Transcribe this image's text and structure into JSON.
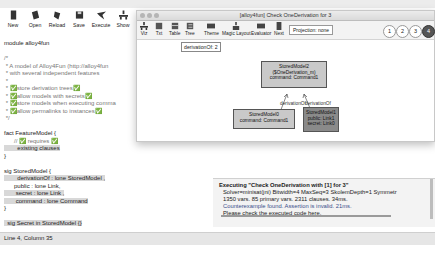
{
  "main_window": {
    "toolbar": [
      {
        "label": "New",
        "icon": "new-file-icon"
      },
      {
        "label": "Open",
        "icon": "open-folder-icon"
      },
      {
        "label": "Reload",
        "icon": "reload-icon"
      },
      {
        "label": "Save",
        "icon": "save-icon"
      },
      {
        "label": "Execute",
        "icon": "execute-icon"
      },
      {
        "label": "Show",
        "icon": "show-icon"
      }
    ],
    "code": [
      "module alloy4fun",
      "",
      "/*",
      " * A model of Alloy4Fun (http://alloy4fun",
      " * with several independent features",
      " *",
      " * ✅store derivation trees✅",
      " * ✅allow models with secrets✅",
      " * ✅store models when executing comma",
      " * ✅allow permalinks to instances✅",
      " */",
      "",
      "fact FeatureModel {",
      "      // ✅ requires ✅",
      "        existing clauses",
      "}",
      "",
      "sig StoredModel {",
      "        derivationOf : lone StoredModel ,",
      "      public : lone Link,",
      "       secret : lone Link ,",
      "       command : lone Command",
      "}",
      "",
      "  sig Secret in StoredModel {}"
    ],
    "status": "Line 4, Column 35"
  },
  "viz_window": {
    "title": "[alloy4fun] Check OneDerivation for 3",
    "toolbar": [
      {
        "label": "Viz",
        "icon": "viz-icon"
      },
      {
        "label": "Txt",
        "icon": "text-icon"
      },
      {
        "label": "Table",
        "icon": "table-icon"
      },
      {
        "label": "Tree",
        "icon": "tree-icon"
      },
      {
        "label": "Theme",
        "icon": "theme-icon"
      },
      {
        "label": "Magic Layout",
        "icon": "magic-layout-icon"
      },
      {
        "label": "Evaluator",
        "icon": "evaluator-icon"
      },
      {
        "label": "Next",
        "icon": "next-icon"
      }
    ],
    "projection": "Projection: none",
    "instances": [
      "1",
      "2",
      "3",
      "4"
    ],
    "active_instance": "4",
    "tag": "derivationOf: 2",
    "nodes": [
      {
        "lines": [
          "StoredModel2",
          "($OneDerivation_m)",
          "command: Command1"
        ]
      },
      {
        "lines": [
          "StoredModel0",
          "command: Command1"
        ]
      },
      {
        "lines": [
          "StoredModel1",
          "public: Link1",
          "secret: Link0"
        ]
      }
    ],
    "edges": [
      {
        "label": "derivationOf"
      },
      {
        "label": "derivationOf"
      }
    ]
  },
  "output": {
    "lines": [
      "Executing \"Check OneDerivation with [1] for 3\"",
      "Solver=minisat(jni) Bitwidth=4 MaxSeq=3 SkolemDepth=1 Symmetr",
      "1350 vars. 85 primary vars. 2311 clauses. 34ms.",
      "Counterexample found. Assertion is invalid. 21ms.",
      "Please check the executed code here."
    ]
  }
}
